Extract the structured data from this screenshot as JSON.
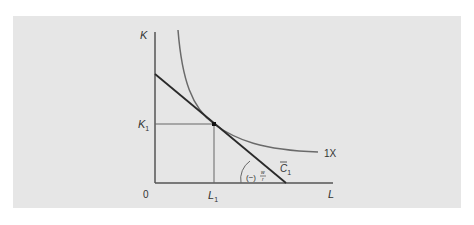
{
  "diagram": {
    "title": "",
    "axes": {
      "y_label": "K",
      "x_label": "L",
      "origin_label": "0"
    },
    "ticks": {
      "k1_main": "K",
      "k1_sub": "1",
      "l1_main": "L",
      "l1_sub": "1"
    },
    "curves": {
      "isoquant_label": "1X",
      "isocost_main": "C",
      "isocost_sub": "1",
      "slope_prefix": "(−)",
      "slope_num": "w",
      "slope_den": "r"
    },
    "colors": {
      "panel": "#e6e6e6",
      "axis": "#555555",
      "isocost": "#2a2a2a",
      "isoquant": "#6a6a6a",
      "text": "#333333"
    }
  }
}
